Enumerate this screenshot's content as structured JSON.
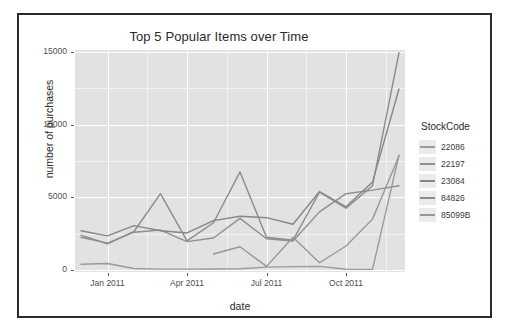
{
  "figure": {
    "title": "Top 5 Popular Items over Time",
    "x_axis_title": "date",
    "y_axis_title": "number of purchases",
    "legend_title": "StockCode"
  },
  "chart_data": {
    "type": "line",
    "title": "Top 5 Popular Items over Time",
    "xlabel": "date",
    "ylabel": "number of purchases",
    "grid": true,
    "legend_position": "right",
    "legend_title": "StockCode",
    "xlim": [
      "2010-12-01",
      "2011-12-01"
    ],
    "ylim": [
      0,
      15000
    ],
    "ytick_labels": [
      "0",
      "5000",
      "10000",
      "15000"
    ],
    "ytick_values": [
      0,
      5000,
      10000,
      15000
    ],
    "xtick_labels": [
      "Jan 2011",
      "Apr 2011",
      "Jul 2011",
      "Oct 2011"
    ],
    "xtick_values": [
      "2011-01-01",
      "2011-04-01",
      "2011-07-01",
      "2011-10-01"
    ],
    "x": [
      "2010-12-01",
      "2011-01-01",
      "2011-02-01",
      "2011-03-01",
      "2011-04-01",
      "2011-05-01",
      "2011-06-01",
      "2011-07-01",
      "2011-08-01",
      "2011-09-01",
      "2011-10-01",
      "2011-11-01",
      "2011-12-01"
    ],
    "series": [
      {
        "name": "22086",
        "color": "#9a9a9a",
        "values": [
          400,
          450,
          100,
          60,
          60,
          70,
          90,
          200,
          230,
          250,
          50,
          40,
          7900
        ]
      },
      {
        "name": "22197",
        "color": "#8f8f8f",
        "values": [
          2250,
          1850,
          2600,
          2750,
          1950,
          2200,
          3550,
          2150,
          2000,
          4000,
          5250,
          5500,
          5800
        ]
      },
      {
        "name": "23084",
        "color": "#868686",
        "values": [
          2700,
          2350,
          3050,
          2700,
          2550,
          3400,
          3700,
          3600,
          3150,
          5400,
          4350,
          6050,
          12450
        ]
      },
      {
        "name": "84826",
        "color": "#8b8b8b",
        "values": [
          2400,
          1800,
          2650,
          5250,
          2000,
          3250,
          6750,
          2250,
          2050,
          5350,
          4250,
          5800,
          14950
        ]
      },
      {
        "name": "85099B",
        "color": "#979797",
        "values": [
          null,
          null,
          null,
          null,
          null,
          1100,
          1600,
          250,
          2250,
          500,
          1650,
          3500,
          7850
        ]
      }
    ]
  },
  "axes": {
    "yticks": [
      {
        "label": "15000",
        "value": 15000
      },
      {
        "label": "10000",
        "value": 10000
      },
      {
        "label": "5000",
        "value": 5000
      },
      {
        "label": "0",
        "value": 0
      }
    ],
    "xticks": [
      {
        "label": "Jan 2011"
      },
      {
        "label": "Apr 2011"
      },
      {
        "label": "Jul 2011"
      },
      {
        "label": "Oct 2011"
      }
    ]
  },
  "legend": {
    "title": "StockCode",
    "items": [
      {
        "label": "22086",
        "color": "#9a9a9a"
      },
      {
        "label": "22197",
        "color": "#8f8f8f"
      },
      {
        "label": "23084",
        "color": "#868686"
      },
      {
        "label": "84826",
        "color": "#8b8b8b"
      },
      {
        "label": "85099B",
        "color": "#979797"
      }
    ]
  }
}
